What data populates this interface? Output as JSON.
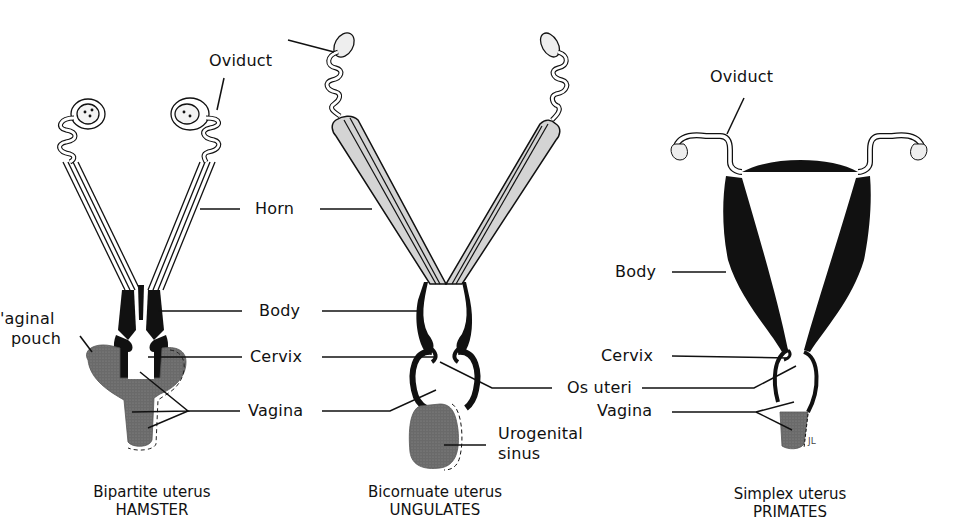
{
  "colors": {
    "ink": "#111111",
    "gray_fill": "#6f6f6f",
    "light_fill": "#d9d9d9",
    "background": "#ffffff"
  },
  "panels": [
    {
      "id": "hamster",
      "caption_line1": "Bipartite uterus",
      "caption_line2": "HAMSTER"
    },
    {
      "id": "ungulates",
      "caption_line1": "Bicornuate uterus",
      "caption_line2": "UNGULATES"
    },
    {
      "id": "primates",
      "caption_line1": "Simplex uterus",
      "caption_line2": "PRIMATES"
    }
  ],
  "labels": {
    "oviduct_left": "Oviduct",
    "horn": "Horn",
    "body_center": "Body",
    "cervix_center": "Cervix",
    "vagina_center": "Vagina",
    "vaginal_pouch_line1": "'aginal",
    "vaginal_pouch_line2": "pouch",
    "os_uteri": "Os uteri",
    "urogenital_line1": "Urogenital",
    "urogenital_line2": "sinus",
    "oviduct_right": "Oviduct",
    "body_right": "Body",
    "cervix_right": "Cervix",
    "vagina_right": "Vagina",
    "artist_initials": "JL"
  }
}
